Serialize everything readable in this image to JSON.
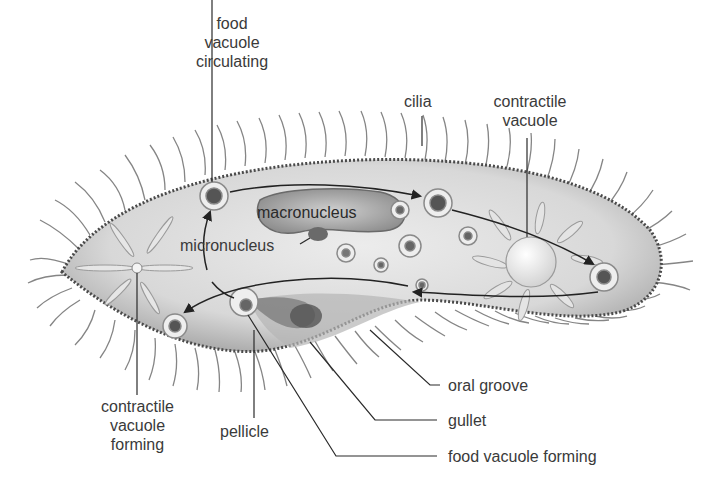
{
  "diagram": {
    "colors": {
      "body_fill": "#dcdcdc",
      "body_edge": "#4a4a4a",
      "cilia": "#6a6a6a",
      "label_text": "#3a3a3a",
      "leader_line": "#2a2a2a",
      "vacuole_fill": "#f0f0f0",
      "nucleus_fill": "#9a9a9a"
    },
    "labels": {
      "food_vacuole_circulating": [
        "food",
        "vacuole",
        "circulating"
      ],
      "cilia": "cilia",
      "contractile_vacuole": [
        "contractile",
        "vacuole"
      ],
      "macronucleus": "macronucleus",
      "micronucleus": "micronucleus",
      "contractile_vacuole_forming": [
        "contractile",
        "vacuole",
        "forming"
      ],
      "pellicle": "pellicle",
      "oral_groove": "oral groove",
      "gullet": "gullet",
      "food_vacuole_forming": "food vacuole forming"
    }
  }
}
